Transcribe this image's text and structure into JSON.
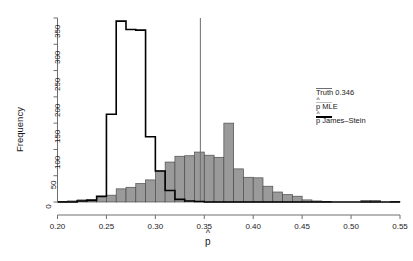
{
  "chart_data": {
    "type": "bar",
    "title": "",
    "subtitle": "",
    "xlabel": "p̂",
    "ylabel": "Frequency",
    "xlim": [
      0.2,
      0.55
    ],
    "ylim": [
      0,
      350
    ],
    "grid": false,
    "legend_position": "right",
    "xticks": [
      "0.20",
      "0.25",
      "0.30",
      "0.35",
      "0.40",
      "0.45",
      "0.50",
      "0.55"
    ],
    "xtick_values": [
      0.2,
      0.25,
      0.3,
      0.35,
      0.4,
      0.45,
      0.5,
      0.55
    ],
    "yticks": [
      "0",
      "50",
      "100",
      "150",
      "200",
      "250",
      "300",
      "350"
    ],
    "ytick_values": [
      0,
      50,
      100,
      150,
      200,
      250,
      300,
      350
    ],
    "bin_width": 0.01,
    "series": [
      {
        "name": "p̂ MLE",
        "style": "filled-bars",
        "color": "#9a9a9a",
        "edge_color": "#4d4d4d",
        "bin_starts": [
          0.2,
          0.21,
          0.22,
          0.23,
          0.24,
          0.25,
          0.26,
          0.27,
          0.28,
          0.29,
          0.3,
          0.31,
          0.32,
          0.33,
          0.34,
          0.35,
          0.36,
          0.37,
          0.38,
          0.39,
          0.4,
          0.41,
          0.42,
          0.43,
          0.44,
          0.45,
          0.46,
          0.47,
          0.48,
          0.49,
          0.5,
          0.51,
          0.52,
          0.53,
          0.54
        ],
        "values": [
          1,
          2,
          4,
          5,
          9,
          13,
          25,
          28,
          35,
          42,
          59,
          76,
          87,
          88,
          95,
          89,
          85,
          150,
          63,
          47,
          46,
          30,
          19,
          14,
          11,
          4,
          2,
          1,
          0,
          0,
          0,
          3,
          3,
          0,
          1
        ]
      },
      {
        "name": "p̂ James–Stein",
        "style": "step-outline",
        "color": "#000000",
        "bin_starts": [
          0.2,
          0.21,
          0.22,
          0.23,
          0.24,
          0.25,
          0.26,
          0.27,
          0.28,
          0.29,
          0.3,
          0.31,
          0.32,
          0.33,
          0.34,
          0.35,
          0.36,
          0.37,
          0.38,
          0.39,
          0.4,
          0.41,
          0.42,
          0.43,
          0.44,
          0.45,
          0.46,
          0.47,
          0.48,
          0.49,
          0.5,
          0.51,
          0.52,
          0.53,
          0.54
        ],
        "values": [
          0,
          0,
          2,
          3,
          11,
          167,
          344,
          328,
          327,
          124,
          59,
          22,
          5,
          2,
          1,
          0,
          0,
          0,
          0,
          0,
          0,
          0,
          0,
          0,
          0,
          0,
          0,
          0,
          0,
          0,
          0,
          0,
          0,
          0,
          0
        ]
      }
    ],
    "annotations": [
      {
        "type": "vline",
        "label": "Truth 0.346",
        "value": 0.346,
        "color": "#6e6e6e"
      }
    ],
    "legend": [
      {
        "label": "Truth 0.346",
        "color": "#6e6e6e",
        "weight": "medium"
      },
      {
        "label": "p̂ MLE",
        "color": "#b0b0b0",
        "weight": "thin"
      },
      {
        "label": "p̂ James–Stein",
        "color": "#000000",
        "weight": "thick"
      }
    ]
  },
  "legend_labels": {
    "truth": "Truth 0.346",
    "mle_prefix": "p",
    "mle_suffix": " MLE",
    "js_prefix": "p",
    "js_suffix": " James–Stein"
  },
  "axes": {
    "ylabel": "Frequency",
    "xlabel_base": "p"
  }
}
